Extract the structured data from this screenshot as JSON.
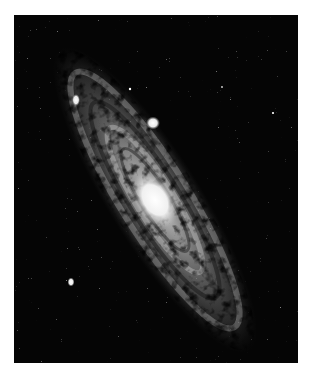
{
  "image": {
    "subject": "spiral galaxy photograph (black and white)",
    "background_color": "#050505",
    "frame_color": "#ffffff",
    "galaxy": {
      "core_center": [
        141,
        185
      ],
      "rotation_deg": -58,
      "core_color": "#f4f4f4",
      "disk_color": "#9a9a9a"
    },
    "satellites": [
      {
        "name": "satellite-upper-right",
        "cx": 139,
        "cy": 108,
        "r": 6
      },
      {
        "name": "satellite-upper-left",
        "cx": 62,
        "cy": 85,
        "r": 4
      },
      {
        "name": "satellite-lower-left",
        "cx": 57,
        "cy": 267,
        "r": 3.5
      }
    ]
  }
}
